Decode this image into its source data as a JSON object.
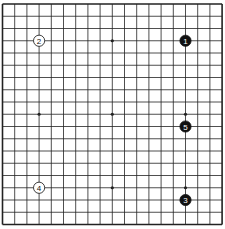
{
  "diagram": {
    "type": "go-board",
    "size": 19,
    "origin": {
      "x": 2.5,
      "y": 4
    },
    "spacing": {
      "x": 12.2,
      "y": 12.25
    },
    "line_color": "#222222",
    "star_points": [
      [
        3,
        3
      ],
      [
        9,
        3
      ],
      [
        15,
        3
      ],
      [
        3,
        9
      ],
      [
        9,
        9
      ],
      [
        15,
        9
      ],
      [
        3,
        15
      ],
      [
        9,
        15
      ],
      [
        15,
        15
      ]
    ],
    "stones": [
      {
        "number": "1",
        "color": "black",
        "col": 15,
        "row": 3
      },
      {
        "number": "2",
        "color": "white",
        "col": 3,
        "row": 3
      },
      {
        "number": "3",
        "color": "black",
        "col": 15,
        "row": 16
      },
      {
        "number": "4",
        "color": "white",
        "col": 3,
        "row": 15
      },
      {
        "number": "5",
        "color": "black",
        "col": 15,
        "row": 10
      }
    ]
  }
}
